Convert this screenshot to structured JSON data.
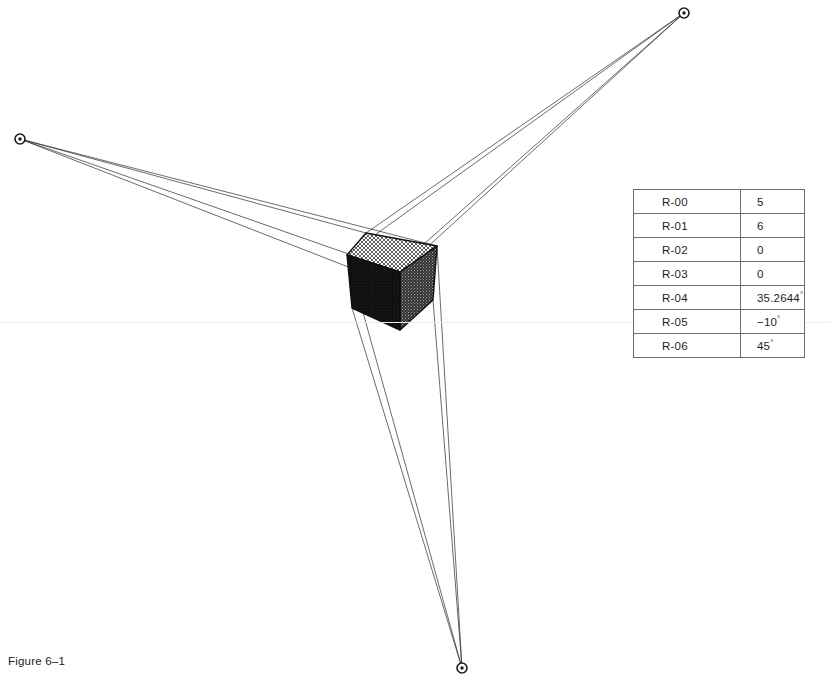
{
  "figure": {
    "caption": "Figure 6–1",
    "width": 830,
    "height": 695,
    "background": "#ffffff",
    "line_color": "#2b2b2b"
  },
  "vanishing_points": [
    {
      "name": "vanishing-point-right",
      "label": "upper-right",
      "x": 684,
      "y": 13,
      "radius": 5
    },
    {
      "name": "vanishing-point-left",
      "label": "left",
      "x": 20,
      "y": 139,
      "radius": 5
    },
    {
      "name": "vanishing-point-bottom",
      "label": "bottom",
      "x": 462,
      "y": 668,
      "radius": 5
    }
  ],
  "cube": {
    "name": "shaded-cube",
    "vertices": {
      "top": {
        "x": 366,
        "y": 233
      },
      "top_left": {
        "x": 347,
        "y": 255
      },
      "top_right": {
        "x": 437,
        "y": 246
      },
      "front": {
        "x": 400,
        "y": 272
      },
      "bottom_left": {
        "x": 352,
        "y": 308
      },
      "bottom_right": {
        "x": 433,
        "y": 300
      },
      "bottom": {
        "x": 400,
        "y": 330
      }
    },
    "faces": [
      {
        "name": "cube-face-top",
        "shading": "cross-hatch",
        "tone": "#e8e8e8"
      },
      {
        "name": "cube-face-left",
        "shading": "solid-dark",
        "tone": "#141414"
      },
      {
        "name": "cube-face-right",
        "shading": "stipple",
        "tone": "#3c3c3c"
      }
    ]
  },
  "table": {
    "name": "parameter-table",
    "rows": [
      {
        "register": "R-00",
        "value": "5",
        "unit": ""
      },
      {
        "register": "R-01",
        "value": "6",
        "unit": ""
      },
      {
        "register": "R-02",
        "value": "0",
        "unit": ""
      },
      {
        "register": "R-03",
        "value": "0",
        "unit": ""
      },
      {
        "register": "R-04",
        "value": "35.2644",
        "unit": "°"
      },
      {
        "register": "R-05",
        "value": "−10",
        "unit": "°"
      },
      {
        "register": "R-06",
        "value": "45",
        "unit": "°"
      }
    ]
  }
}
